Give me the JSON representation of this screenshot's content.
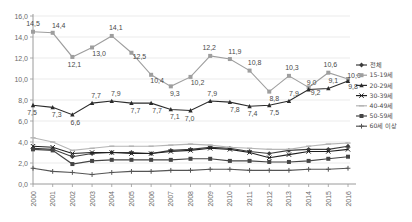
{
  "chart_data": {
    "type": "line",
    "title": "",
    "subtitle": "",
    "xlabel": "",
    "ylabel": "",
    "ylim": [
      0.0,
      16.0
    ],
    "y_ticks": [
      "0,0",
      "2,0",
      "4,0",
      "6,0",
      "8,0",
      "10,0",
      "12,0",
      "14,0",
      "16,0"
    ],
    "y_tick_values": [
      0,
      2,
      4,
      6,
      8,
      10,
      12,
      14,
      16
    ],
    "grid": true,
    "legend_position": "right",
    "decimal_separator": ",",
    "categories": [
      "2000",
      "2001",
      "2002",
      "2003",
      "2004",
      "2005",
      "2006",
      "2007",
      "2008",
      "2009",
      "2010",
      "2011",
      "2012",
      "2013",
      "2014",
      "2015",
      "2016"
    ],
    "x": [
      2000,
      2001,
      2002,
      2003,
      2004,
      2005,
      2006,
      2007,
      2008,
      2009,
      2010,
      2011,
      2012,
      2013,
      2014,
      2015,
      2016
    ],
    "series": [
      {
        "name": "전체",
        "color": "#3d3d3d",
        "marker": "diamond",
        "labeled": false,
        "values": [
          3.4,
          3.3,
          2.6,
          2.9,
          3.0,
          3.0,
          2.9,
          3.2,
          3.3,
          3.5,
          3.4,
          3.1,
          2.9,
          3.2,
          3.3,
          3.3,
          3.6
        ]
      },
      {
        "name": "15-19세",
        "color": "#9e9e9e",
        "marker": "square",
        "labeled": true,
        "values": [
          14.5,
          14.4,
          12.1,
          13.0,
          14.1,
          12.5,
          10.4,
          9.3,
          10.2,
          12.2,
          11.9,
          10.8,
          8.8,
          10.3,
          9.2,
          10.6,
          10.0
        ],
        "labels": [
          "14,5",
          "14,4",
          "12,1",
          "13,0",
          "14,1",
          "12,5",
          "10,4",
          "9,3",
          "10,2",
          "12,2",
          "11,9",
          "10,8",
          "8,8",
          "10,3",
          "9,2",
          "10,6",
          "10,0"
        ]
      },
      {
        "name": "20-29세",
        "color": "#2b2b2b",
        "marker": "triangle",
        "labeled": true,
        "values": [
          7.5,
          7.3,
          6.6,
          7.7,
          7.9,
          7.7,
          7.7,
          7.1,
          7.0,
          7.9,
          7.8,
          7.4,
          7.5,
          7.9,
          9.0,
          9.1,
          9.8
        ],
        "labels": [
          "7,5",
          "7,3",
          "6,6",
          "7,7",
          "7,9",
          "7,7",
          "7,7",
          "7,1",
          "7,0",
          "7,9",
          "7,8",
          "7,4",
          "7,5",
          "7,9",
          "9,0",
          "9,1",
          "9,8"
        ]
      },
      {
        "name": "30-39세",
        "color": "#1f1f1f",
        "marker": "cross",
        "labeled": false,
        "values": [
          3.6,
          3.5,
          2.9,
          3.0,
          3.0,
          2.9,
          2.9,
          3.1,
          3.2,
          3.4,
          3.3,
          3.0,
          2.5,
          2.8,
          3.1,
          3.1,
          3.3
        ]
      },
      {
        "name": "40-49세",
        "color": "#b5b5b5",
        "marker": "dash",
        "labeled": false,
        "values": [
          4.4,
          4.0,
          3.2,
          3.4,
          3.6,
          3.6,
          3.6,
          3.7,
          3.8,
          3.7,
          3.5,
          3.4,
          3.3,
          3.3,
          3.6,
          3.8,
          3.9
        ]
      },
      {
        "name": "50-59세",
        "color": "#454545",
        "marker": "square",
        "labeled": false,
        "values": [
          3.3,
          3.2,
          1.9,
          2.2,
          2.3,
          2.3,
          2.3,
          2.3,
          2.4,
          2.4,
          2.2,
          2.2,
          2.1,
          2.1,
          2.2,
          2.4,
          2.6
        ]
      },
      {
        "name": "60세 이상",
        "color": "#555555",
        "marker": "plus",
        "labeled": false,
        "values": [
          1.5,
          1.2,
          1.1,
          0.9,
          1.1,
          1.2,
          1.2,
          1.3,
          1.3,
          1.4,
          1.4,
          1.3,
          1.3,
          1.3,
          1.4,
          1.4,
          1.5
        ]
      }
    ]
  },
  "legend": {
    "items": [
      {
        "label": "전체"
      },
      {
        "label": "15-19세"
      },
      {
        "label": "20-29세"
      },
      {
        "label": "30-39세"
      },
      {
        "label": "40-49세"
      },
      {
        "label": "50-59세"
      },
      {
        "label": "60세 이상"
      }
    ]
  }
}
